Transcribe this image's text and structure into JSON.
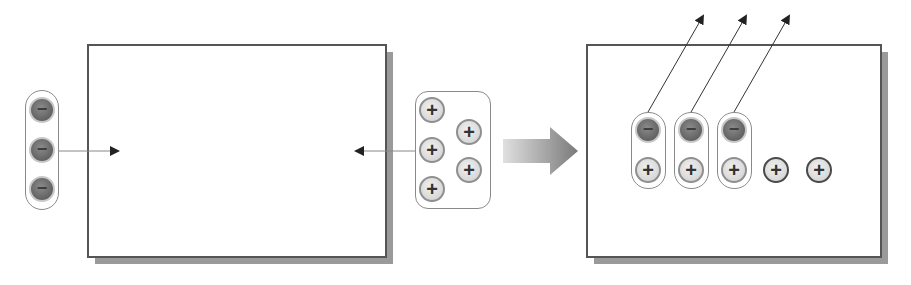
{
  "diagram": {
    "left_panel": {
      "incoming_negative_ions": [
        "−",
        "−",
        "−"
      ],
      "incoming_positive_ions": [
        "+",
        "+",
        "+",
        "+",
        "+"
      ]
    },
    "transition_arrow": "right-arrow",
    "right_panel": {
      "paired_ions": [
        {
          "negative": "−",
          "positive": "+"
        },
        {
          "negative": "−",
          "positive": "+"
        },
        {
          "negative": "−",
          "positive": "+"
        }
      ],
      "free_positive_ions": [
        "+",
        "+"
      ]
    },
    "symbols": {
      "negative": "−",
      "positive": "+"
    },
    "colors": {
      "box_border": "#555555",
      "shadow": "#9a9a9a",
      "negative_ion": "#6e6e6e",
      "positive_ion": "#e2e2e2",
      "arrow": "#222222"
    }
  }
}
